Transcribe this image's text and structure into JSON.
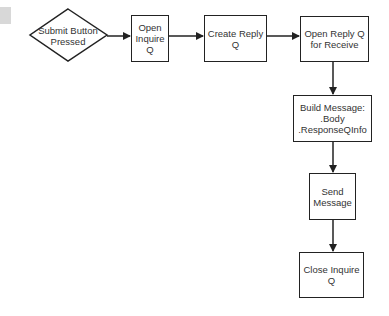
{
  "diagram": {
    "type": "flowchart",
    "start": {
      "label": "Submit Button\nPressed",
      "shape": "diamond"
    },
    "nodes": [
      {
        "id": "open-inquire",
        "label": "Open\nInquire\nQ"
      },
      {
        "id": "create-reply",
        "label": "Create Reply\nQ"
      },
      {
        "id": "open-reply-receive",
        "label": "Open Reply Q\nfor Receive"
      },
      {
        "id": "build-message",
        "label": "Build Message:\n.Body\n.ResponseQInfo"
      },
      {
        "id": "send-message",
        "label": "Send\nMessage"
      },
      {
        "id": "close-inquire",
        "label": "Close Inquire\nQ"
      }
    ],
    "edges": [
      {
        "from": "start",
        "to": "open-inquire"
      },
      {
        "from": "open-inquire",
        "to": "create-reply"
      },
      {
        "from": "create-reply",
        "to": "open-reply-receive"
      },
      {
        "from": "open-reply-receive",
        "to": "build-message"
      },
      {
        "from": "build-message",
        "to": "send-message"
      },
      {
        "from": "send-message",
        "to": "close-inquire"
      }
    ],
    "colors": {
      "stroke": "#222222",
      "text": "#333333",
      "corner_swatch": "#d8d8d8"
    }
  }
}
